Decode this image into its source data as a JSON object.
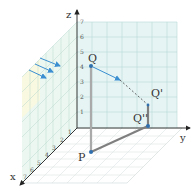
{
  "diagram": {
    "type": "3d-coordinate-projection",
    "axes": {
      "z": {
        "label": "z",
        "ticks": [
          "1",
          "2",
          "3",
          "4",
          "5",
          "6",
          "7"
        ]
      },
      "y": {
        "label": "y"
      },
      "x": {
        "label": "x",
        "ticks": [
          "1",
          "2",
          "3",
          "4",
          "5",
          "6",
          "7"
        ]
      }
    },
    "points": {
      "Q": {
        "label": "Q"
      },
      "Q_prime": {
        "label": "Q'"
      },
      "Q_double_prime": {
        "label": "Q''"
      },
      "P": {
        "label": "P"
      }
    },
    "colors": {
      "grid_wall": "#e6f5f4",
      "grid_line": "#b9d8d6",
      "left_wall": "#eef7ee",
      "left_wall_highlight": "#fbf8df",
      "axis": "#333333",
      "segment": "#8a8a8a",
      "point": "#2f6fae",
      "arrow": "#3b8fd1"
    }
  }
}
